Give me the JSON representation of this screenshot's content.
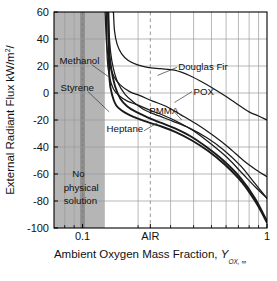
{
  "figure": {
    "background_color": "#ffffff",
    "plot_border_color": "#000000",
    "grid_color": "#9a9a9a",
    "shaded_region_color": "#b5b5b5",
    "shaded_band_color": "#8f8f8f",
    "curve_color": "#1a1a1a"
  },
  "axes": {
    "x": {
      "label_main": "Ambient Oxygen Mass Fraction,",
      "label_symbol": "Y",
      "label_subscript": "OX, ∞",
      "scale": "log",
      "range": [
        0.07,
        1.0
      ],
      "tick_labels": [
        "0.1",
        "AIR",
        "1"
      ],
      "tick_values": [
        0.1,
        0.233,
        1.0
      ],
      "minor_gridlines": [
        0.08,
        0.09,
        0.2,
        0.3,
        0.4,
        0.5,
        0.6,
        0.7,
        0.8,
        0.9
      ],
      "air_value": 0.233,
      "air_label": "AIR"
    },
    "y": {
      "label_main": "External Radiant Flux kW/m",
      "label_exponent": "2",
      "label_tail": "/",
      "scale": "linear",
      "range": [
        -100,
        60
      ],
      "tick_labels": [
        "60",
        "40",
        "20",
        "0",
        "-20",
        "-40",
        "-60",
        "-80",
        "-100"
      ],
      "tick_values": [
        60,
        40,
        20,
        0,
        -20,
        -40,
        -60,
        -80,
        -100
      ]
    }
  },
  "annotations": [
    {
      "name": "methanol-label",
      "text": "Methanol",
      "x": 0.075,
      "y": 24
    },
    {
      "name": "styrene-label",
      "text": "Styrene",
      "x": 0.076,
      "y": 4
    },
    {
      "name": "douglas-fir-label",
      "text": "Douglas Fir",
      "x": 0.33,
      "y": 19
    },
    {
      "name": "pox-label",
      "text": "POX",
      "x": 0.4,
      "y": 1
    },
    {
      "name": "pmma-label",
      "text": "PMMA",
      "x": 0.23,
      "y": -13
    },
    {
      "name": "heptane-label",
      "text": "Heptane",
      "x": 0.135,
      "y": -27
    },
    {
      "name": "no-physical-solution-line1",
      "text": "No",
      "x": 0.088,
      "y": -60
    },
    {
      "name": "no-physical-solution-line2",
      "text": "physical",
      "x": 0.079,
      "y": -70
    },
    {
      "name": "no-physical-solution-line3",
      "text": "solution",
      "x": 0.079,
      "y": -80
    }
  ],
  "chart_data": {
    "type": "line",
    "title": "",
    "xlabel": "Ambient Oxygen Mass Fraction, Y_OX,∞",
    "ylabel": "External Radiant Flux kW/m2/",
    "xscale": "log",
    "xlim": [
      0.07,
      1.0
    ],
    "ylim": [
      -100,
      60
    ],
    "grid": true,
    "legend": "inline-annotations",
    "shaded_region": {
      "label": "No physical solution",
      "x_from": 0.07,
      "x_to": 0.132
    },
    "shaded_band": {
      "x_from": 0.097,
      "x_to": 0.103
    },
    "series": [
      {
        "name": "Methanol",
        "asymptote_x": 0.137,
        "x": [
          0.1375,
          0.139,
          0.142,
          0.147,
          0.155,
          0.17,
          0.19,
          0.22,
          0.26,
          0.31,
          0.38,
          0.47,
          0.58,
          0.72,
          0.86,
          1.0
        ],
        "y": [
          60,
          46,
          30,
          18,
          8,
          -1,
          -7,
          -13,
          -17,
          -21,
          -26,
          -33,
          -42,
          -54,
          -67,
          -78
        ]
      },
      {
        "name": "Styrene",
        "asymptote_x": 0.137,
        "x": [
          0.1375,
          0.139,
          0.143,
          0.15,
          0.16,
          0.175,
          0.195,
          0.225,
          0.265,
          0.315,
          0.385,
          0.47,
          0.58,
          0.72,
          0.86,
          1.0
        ],
        "y": [
          60,
          34,
          18,
          5,
          -4,
          -10,
          -14,
          -18,
          -22,
          -26,
          -32,
          -40,
          -50,
          -63,
          -78,
          -95
        ]
      },
      {
        "name": "Heptane",
        "asymptote_x": 0.138,
        "x": [
          0.1385,
          0.14,
          0.145,
          0.152,
          0.163,
          0.178,
          0.2,
          0.23,
          0.27,
          0.32,
          0.39,
          0.48,
          0.59,
          0.73,
          0.87,
          1.0
        ],
        "y": [
          40,
          10,
          -2,
          -9,
          -13,
          -16,
          -19,
          -22,
          -25,
          -29,
          -35,
          -43,
          -53,
          -66,
          -81,
          -96
        ]
      },
      {
        "name": "PMMA",
        "asymptote_x": 0.134,
        "x": [
          0.1345,
          0.136,
          0.14,
          0.147,
          0.158,
          0.175,
          0.2,
          0.235,
          0.28,
          0.335,
          0.41,
          0.5,
          0.61,
          0.74,
          0.87,
          1.0
        ],
        "y": [
          60,
          26,
          12,
          3,
          -2,
          -6,
          -9,
          -13,
          -17,
          -22,
          -29,
          -38,
          -48,
          -60,
          -70,
          -78
        ]
      },
      {
        "name": "POX",
        "asymptote_x": 0.132,
        "x": [
          0.1325,
          0.135,
          0.14,
          0.148,
          0.16,
          0.18,
          0.205,
          0.24,
          0.285,
          0.34,
          0.415,
          0.505,
          0.615,
          0.745,
          0.875,
          1.0
        ],
        "y": [
          60,
          36,
          22,
          12,
          6,
          1,
          -2,
          -6,
          -10,
          -16,
          -23,
          -31,
          -40,
          -50,
          -57,
          -62
        ]
      },
      {
        "name": "Douglas Fir",
        "asymptote_x": 0.146,
        "x": [
          0.147,
          0.149,
          0.154,
          0.163,
          0.177,
          0.197,
          0.225,
          0.265,
          0.315,
          0.38,
          0.46,
          0.56,
          0.67,
          0.8,
          0.9,
          1.0
        ],
        "y": [
          60,
          46,
          36,
          29,
          24,
          21,
          19,
          18,
          17,
          13,
          7,
          0,
          -7,
          -14,
          -17,
          -20
        ]
      }
    ]
  }
}
